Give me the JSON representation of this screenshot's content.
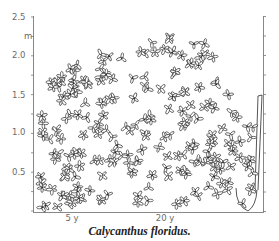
{
  "figure": {
    "caption": "Calycanthus floridus.",
    "y_unit": "m",
    "y_ticks": [
      {
        "label": "2.5",
        "y": 17
      },
      {
        "label": "2.0",
        "y": 55
      },
      {
        "label": "1.5",
        "y": 95
      },
      {
        "label": "1.0",
        "y": 132
      },
      {
        "label": "0.5",
        "y": 172
      }
    ],
    "x_ticks": [
      {
        "label": "5 y",
        "x": 72
      },
      {
        "label": "20 y",
        "x": 165
      }
    ],
    "colors": {
      "ink": "#2a2a2a",
      "axis": "#7a7a7a",
      "label": "#6a6a6a"
    }
  },
  "chart_data": {
    "type": "diagram",
    "title": "Calycanthus floridus.",
    "ylabel": "m",
    "ylim": [
      0,
      2.5
    ],
    "y_tick_labels": [
      "0.5",
      "1.0",
      "1.5",
      "2.0",
      "2.5"
    ],
    "x_tick_labels": [
      "5 y",
      "20 y"
    ],
    "series": [
      {
        "name": "20 y shrub",
        "max_height_m": 2.4,
        "description": "broad rounded shrub canopy of outlined leaves"
      },
      {
        "name": "5 y plant",
        "max_height_m": 1.5,
        "description": "young plant with tall stem, at right edge"
      }
    ]
  }
}
